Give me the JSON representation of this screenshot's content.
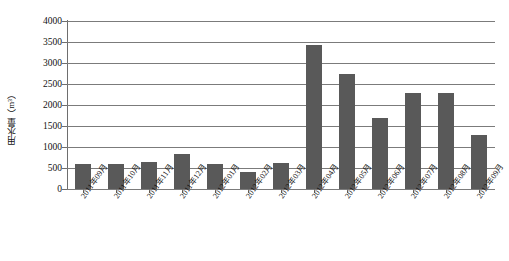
{
  "chart_data": {
    "type": "bar",
    "title": "",
    "xlabel": "",
    "ylabel": "用水量（m³）",
    "ylim": [
      0,
      4000
    ],
    "ytick_labels": [
      "4000",
      "3500",
      "3000",
      "2500",
      "2000",
      "1500",
      "1000",
      "500",
      "0"
    ],
    "ytick_values": [
      4000,
      3500,
      3000,
      2500,
      2000,
      1500,
      1000,
      500,
      0
    ],
    "grid": true,
    "legend": "none",
    "series_color": "#595959",
    "categories": [
      "2011年09月",
      "2011年10月",
      "2011年11月",
      "2011年12月",
      "2012年01月",
      "2012年02月",
      "2012年03月",
      "2012年04月",
      "2012年05月",
      "2012年06月",
      "2012年07月",
      "2012年08月",
      "2012年09月"
    ],
    "values": [
      600,
      600,
      650,
      830,
      600,
      400,
      620,
      3430,
      2750,
      1700,
      2280,
      2280,
      1280
    ]
  }
}
